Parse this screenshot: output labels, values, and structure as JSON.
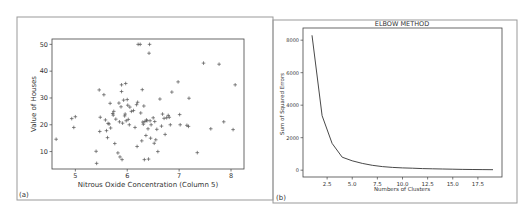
{
  "panels": [
    {
      "label": "(a)"
    },
    {
      "label": "(b)"
    }
  ],
  "chart_data": [
    {
      "type": "scatter",
      "panel": "(a)",
      "title": "",
      "xlabel": "Nitrous Oxide Concentration (Column 5)",
      "ylabel": "Value of Houses",
      "xlim": [
        4.55,
        8.25
      ],
      "ylim": [
        3.5,
        52
      ],
      "xticks": [
        "5",
        "6",
        "7",
        "8"
      ],
      "yticks": [
        "10",
        "20",
        "30",
        "40",
        "50"
      ],
      "grid": false,
      "marker": "+",
      "points": [
        [
          4.63,
          14.6
        ],
        [
          4.93,
          22.3
        ],
        [
          5.0,
          23.0
        ],
        [
          4.97,
          19.0
        ],
        [
          5.4,
          10.1
        ],
        [
          5.41,
          5.6
        ],
        [
          5.46,
          33.0
        ],
        [
          5.47,
          17.5
        ],
        [
          5.48,
          22.8
        ],
        [
          5.55,
          31.2
        ],
        [
          5.58,
          21.8
        ],
        [
          5.6,
          17.8
        ],
        [
          5.62,
          15.2
        ],
        [
          5.63,
          20.5
        ],
        [
          5.65,
          20.3
        ],
        [
          5.67,
          28.0
        ],
        [
          5.68,
          18.8
        ],
        [
          5.72,
          24.2
        ],
        [
          5.73,
          23.6
        ],
        [
          5.74,
          25.0
        ],
        [
          5.76,
          13.0
        ],
        [
          5.78,
          22.1
        ],
        [
          5.82,
          9.5
        ],
        [
          5.84,
          28.1
        ],
        [
          5.85,
          21.1
        ],
        [
          5.86,
          8.0
        ],
        [
          5.88,
          26.7
        ],
        [
          5.89,
          32.4
        ],
        [
          5.89,
          34.9
        ],
        [
          5.9,
          7.0
        ],
        [
          5.91,
          20.6
        ],
        [
          5.93,
          29.2
        ],
        [
          5.95,
          23.3
        ],
        [
          5.96,
          24.0
        ],
        [
          5.97,
          35.4
        ],
        [
          5.98,
          21.5
        ],
        [
          6.0,
          29.4
        ],
        [
          6.01,
          27.3
        ],
        [
          6.02,
          22.0
        ],
        [
          6.04,
          20.0
        ],
        [
          6.05,
          26.6
        ],
        [
          6.08,
          25.0
        ],
        [
          6.12,
          25.3
        ],
        [
          6.15,
          19.0
        ],
        [
          6.18,
          27.5
        ],
        [
          6.19,
          11.9
        ],
        [
          6.2,
          28.4
        ],
        [
          6.21,
          50.0
        ],
        [
          6.25,
          50.0
        ],
        [
          6.26,
          24.4
        ],
        [
          6.28,
          14.0
        ],
        [
          6.29,
          33.1
        ],
        [
          6.3,
          21.0
        ],
        [
          6.31,
          20.2
        ],
        [
          6.32,
          27.0
        ],
        [
          6.33,
          7.0
        ],
        [
          6.34,
          21.2
        ],
        [
          6.36,
          16.0
        ],
        [
          6.37,
          21.8
        ],
        [
          6.38,
          21.5
        ],
        [
          6.4,
          18.5
        ],
        [
          6.41,
          7.2
        ],
        [
          6.42,
          46.7
        ],
        [
          6.43,
          50.0
        ],
        [
          6.44,
          21.5
        ],
        [
          6.45,
          15.0
        ],
        [
          6.46,
          20.0
        ],
        [
          6.5,
          22.6
        ],
        [
          6.52,
          13.1
        ],
        [
          6.53,
          21.2
        ],
        [
          6.55,
          14.4
        ],
        [
          6.57,
          18.3
        ],
        [
          6.59,
          10.0
        ],
        [
          6.63,
          29.6
        ],
        [
          6.66,
          19.5
        ],
        [
          6.68,
          24.0
        ],
        [
          6.71,
          22.4
        ],
        [
          6.73,
          16.4
        ],
        [
          6.76,
          22.6
        ],
        [
          6.79,
          23.5
        ],
        [
          6.81,
          22.8
        ],
        [
          6.83,
          20.0
        ],
        [
          6.86,
          32.2
        ],
        [
          6.98,
          36.0
        ],
        [
          7.01,
          23.8
        ],
        [
          7.02,
          20.0
        ],
        [
          7.15,
          19.8
        ],
        [
          7.18,
          19.4
        ],
        [
          7.19,
          29.9
        ],
        [
          7.35,
          9.6
        ],
        [
          7.47,
          43.0
        ],
        [
          7.61,
          18.5
        ],
        [
          7.77,
          42.6
        ],
        [
          7.86,
          21.1
        ],
        [
          8.04,
          18.2
        ],
        [
          8.08,
          34.9
        ]
      ]
    },
    {
      "type": "line",
      "panel": "(b)",
      "title": "ELBOW METHOD",
      "xlabel": "Numbers of Clusters",
      "ylabel": "Sum of Squared Errors",
      "xlim": [
        0.1,
        19.9
      ],
      "ylim": [
        -420,
        8750
      ],
      "xticks": [
        "2.5",
        "5.0",
        "7.5",
        "10.0",
        "12.5",
        "15.0",
        "17.5"
      ],
      "yticks": [
        "0",
        "2000",
        "4000",
        "6000",
        "8000"
      ],
      "grid": false,
      "x": [
        1,
        2,
        3,
        4,
        5,
        6,
        7,
        8,
        9,
        10,
        11,
        12,
        13,
        14,
        15,
        16,
        17,
        18,
        19
      ],
      "values": [
        8300,
        3350,
        1650,
        800,
        580,
        420,
        300,
        220,
        170,
        140,
        120,
        100,
        85,
        70,
        60,
        50,
        40,
        35,
        30
      ]
    }
  ]
}
